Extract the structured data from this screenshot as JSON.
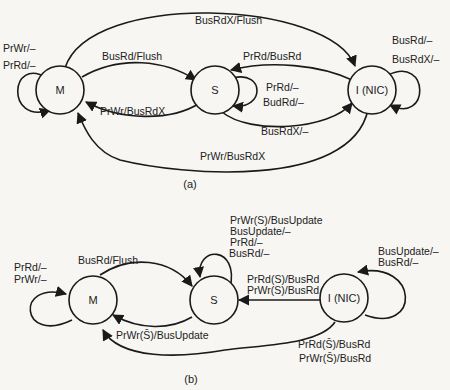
{
  "diagram_a": {
    "caption": "(a)",
    "nodes": {
      "M": "M",
      "S": "S",
      "I": "I (NIC)"
    },
    "edges": {
      "m_self_1": "PrWr/–",
      "m_self_2": "PrRd/–",
      "m_to_i": "BusRdX/Flush",
      "m_to_s": "BusRd/Flush",
      "s_to_m": "PrWr/BusRdX",
      "i_to_s": "PrRd/BusRd",
      "s_self_1": "PrRd/–",
      "s_self_2": "BudRd/–",
      "s_to_i": "BusRdX/–",
      "i_to_m": "PrWr/BusRdX",
      "i_self_1": "BusRd/–",
      "i_self_2": "BusRdX/–"
    }
  },
  "diagram_b": {
    "caption": "(b)",
    "nodes": {
      "M": "M",
      "S": "S",
      "I": "I (NIC)"
    },
    "edges": {
      "m_self_1": "PrRd/–",
      "m_self_2": "PrWr/–",
      "m_to_s": "BusRd/Flush",
      "s_to_m": "PrWr(S̄)/BusUpdate",
      "s_self_1": "PrWr(S)/BusUpdate",
      "s_self_2": "BusUpdate/–",
      "s_self_3": "PrRd/–",
      "s_self_4": "BusRd/–",
      "i_to_s_1": "PrRd(S)/BusRd",
      "i_to_s_2": "PrWr(S)/BusRd",
      "i_self_1": "BusUpdate/–",
      "i_self_2": "BusRd/–",
      "i_to_m_1": "PrRd(S̄)/BusRd",
      "i_to_m_2": "PrWr(S̄)/BusRd"
    }
  }
}
